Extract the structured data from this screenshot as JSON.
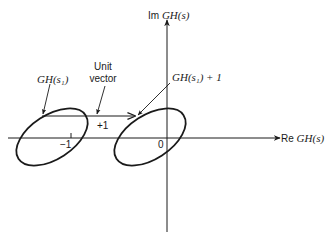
{
  "diagram": {
    "type": "nyquist-plane-shift",
    "axes": {
      "x_label_prefix": "Re",
      "x_label_func": "GH(s)",
      "y_label_prefix": "Im",
      "y_label_func": "GH(s)",
      "origin_label": "0",
      "tick_minus_one_label": "−1"
    },
    "labels": {
      "gh_s1": "GH(s₁)",
      "unit_line1": "Unit",
      "unit_line2": "vector",
      "gh_s1_plus_1": "GH(s₁) + 1",
      "plus_one": "+1"
    },
    "shapes": {
      "left_contour": "ellipse centered near -1 on real axis, tilted",
      "right_contour": "same ellipse shifted by +1, centered near origin",
      "unit_vector": "horizontal arrow from GH(s1) to GH(s1)+1"
    },
    "colors": {
      "stroke": "#1a1a1a",
      "background": "#ffffff"
    }
  }
}
